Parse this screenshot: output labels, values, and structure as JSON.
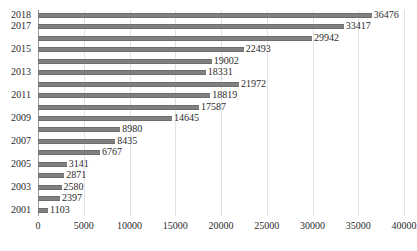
{
  "chart_data": {
    "type": "bar",
    "orientation": "horizontal",
    "title": "",
    "subtitle": "",
    "xlabel": "",
    "ylabel": "",
    "xlim": [
      0,
      40000
    ],
    "ylim": null,
    "grid": true,
    "grid_axis": "x",
    "legend": null,
    "legend_position": "none",
    "data_labels": true,
    "categories": [
      "2018",
      "2017",
      "2016",
      "2015",
      "2014",
      "2013",
      "2012",
      "2011",
      "2010",
      "2009",
      "2008",
      "2007",
      "2006",
      "2005",
      "2004",
      "2003",
      "2002",
      "2001"
    ],
    "visible_tick_labels": [
      "2018",
      "2017",
      "",
      "2015",
      "",
      "2013",
      "",
      "2011",
      "",
      "2009",
      "",
      "2007",
      "",
      "2005",
      "",
      "2003",
      "",
      "2001"
    ],
    "values": [
      36476,
      33417,
      29942,
      22493,
      19002,
      18331,
      21972,
      18819,
      17587,
      14645,
      8980,
      8435,
      6767,
      3141,
      2871,
      2580,
      2397,
      1103
    ],
    "value_labels": [
      "36476",
      "33417",
      "29942",
      "22493",
      "19002",
      "18331",
      "21972",
      "18819",
      "17587",
      "14645",
      "8980",
      "8435",
      "6767",
      "3141",
      "2871",
      "2580",
      "2397",
      "1103"
    ],
    "x_ticks": [
      0,
      5000,
      10000,
      15000,
      20000,
      25000,
      30000,
      35000,
      40000
    ],
    "x_tick_labels": [
      "0",
      "5000",
      "10000",
      "15000",
      "20000",
      "25000",
      "30000",
      "35000",
      "40000"
    ],
    "series": [
      {
        "name": "",
        "color": "#808080",
        "values": [
          36476,
          33417,
          29942,
          22493,
          19002,
          18331,
          21972,
          18819,
          17587,
          14645,
          8980,
          8435,
          6767,
          3141,
          2871,
          2580,
          2397,
          1103
        ]
      }
    ],
    "colors": {
      "bar": "#808080",
      "bar_edge": "#6d6d6d",
      "grid": "#e2e2e2",
      "axis": "#9a9a9a",
      "text": "#2b2b2b",
      "background": "#ffffff"
    }
  }
}
